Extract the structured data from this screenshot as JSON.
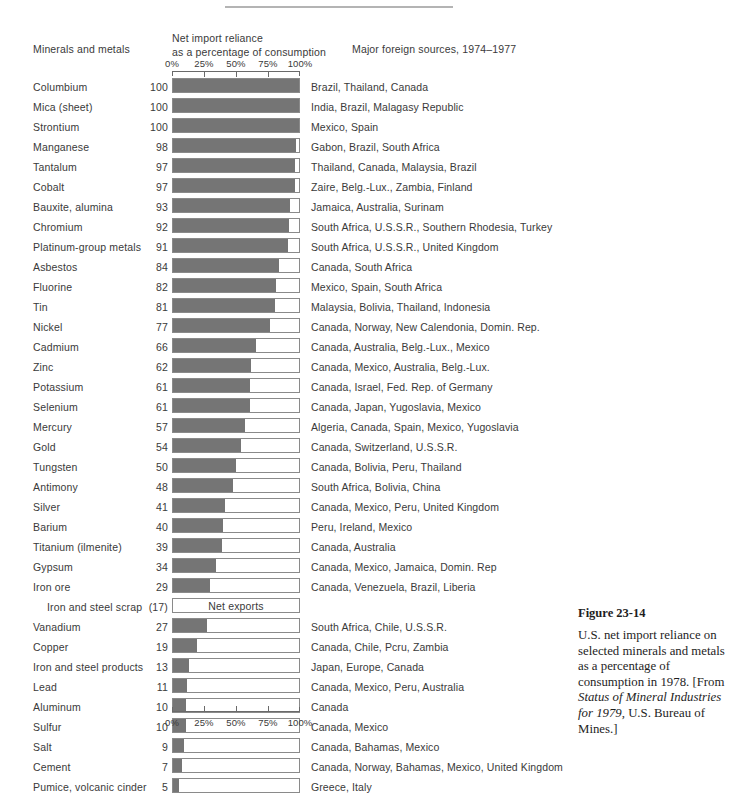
{
  "header": {
    "minerals_label": "Minerals and metals",
    "reliance_line1": "Net import reliance",
    "reliance_line2": "as a percentage of consumption",
    "sources_label": "Major foreign sources, 1974–1977"
  },
  "figure": {
    "number": "Figure 23-14",
    "caption_part1": "U.S. net import reliance on selected minerals and metals as a percentage of consumption in 1978. [From ",
    "caption_italic1": "Status of Mineral Industries for 1979",
    "caption_part2": ", U.S. Bureau of Mines.]"
  },
  "chart_data": {
    "type": "bar",
    "orientation": "horizontal",
    "title": "U.S. net import reliance on selected minerals and metals as a percentage of consumption in 1978.",
    "xlabel": "Net import reliance as a percentage of consumption",
    "ylabel": "Minerals and metals",
    "xlim": [
      0,
      100
    ],
    "tick_labels": [
      "0%",
      "25%",
      "50%",
      "75%",
      "100%"
    ],
    "tick_values": [
      0,
      25,
      50,
      75,
      100
    ],
    "grid": false,
    "legend": "none",
    "bar_color": "#757575",
    "bar_outline_color": "#8a8a8a",
    "axis_color": "#6a6a6a",
    "categories": [
      "Columbium",
      "Mica (sheet)",
      "Strontium",
      "Manganese",
      "Tantalum",
      "Cobalt",
      "Bauxite, alumina",
      "Chromium",
      "Platinum-group metals",
      "Asbestos",
      "Fluorine",
      "Tin",
      "Nickel",
      "Cadmium",
      "Zinc",
      "Potassium",
      "Selenium",
      "Mercury",
      "Gold",
      "Tungsten",
      "Antimony",
      "Silver",
      "Barium",
      "Titanium (ilmenite)",
      "Gypsum",
      "Iron ore",
      "Iron and steel scrap",
      "Vanadium",
      "Copper",
      "Iron and steel products",
      "Lead",
      "Aluminum",
      "Sulfur",
      "Salt",
      "Cement",
      "Pumice, volcanic cinder"
    ],
    "values": [
      100,
      100,
      100,
      98,
      97,
      97,
      93,
      92,
      91,
      84,
      82,
      81,
      77,
      66,
      62,
      61,
      61,
      57,
      54,
      50,
      48,
      41,
      40,
      39,
      34,
      29,
      -17,
      27,
      19,
      13,
      11,
      10,
      10,
      9,
      7,
      5
    ],
    "rows": [
      {
        "label": "Columbium",
        "value": "100",
        "pct": 100,
        "sources": "Brazil, Thailand, Canada",
        "indent": false
      },
      {
        "label": "Mica (sheet)",
        "value": "100",
        "pct": 100,
        "sources": "India, Brazil, Malagasy Republic",
        "indent": false
      },
      {
        "label": "Strontium",
        "value": "100",
        "pct": 100,
        "sources": "Mexico, Spain",
        "indent": false
      },
      {
        "label": "Manganese",
        "value": "98",
        "pct": 98,
        "sources": "Gabon, Brazil, South Africa",
        "indent": false
      },
      {
        "label": "Tantalum",
        "value": "97",
        "pct": 97,
        "sources": "Thailand, Canada, Malaysia, Brazil",
        "indent": false
      },
      {
        "label": "Cobalt",
        "value": "97",
        "pct": 97,
        "sources": "Zaire, Belg.-Lux., Zambia, Finland",
        "indent": false
      },
      {
        "label": "Bauxite, alumina",
        "value": "93",
        "pct": 93,
        "sources": "Jamaica, Australia, Surinam",
        "indent": false
      },
      {
        "label": "Chromium",
        "value": "92",
        "pct": 92,
        "sources": "South Africa, U.S.S.R., Southern Rhodesia, Turkey",
        "indent": false
      },
      {
        "label": "Platinum-group metals",
        "value": "91",
        "pct": 91,
        "sources": "South Africa, U.S.S.R., United Kingdom",
        "indent": false
      },
      {
        "label": "Asbestos",
        "value": "84",
        "pct": 84,
        "sources": "Canada, South Africa",
        "indent": false
      },
      {
        "label": "Fluorine",
        "value": "82",
        "pct": 82,
        "sources": "Mexico, Spain, South Africa",
        "indent": false
      },
      {
        "label": "Tin",
        "value": "81",
        "pct": 81,
        "sources": "Malaysia, Bolivia, Thailand, Indonesia",
        "indent": false
      },
      {
        "label": "Nickel",
        "value": "77",
        "pct": 77,
        "sources": "Canada, Norway, New Calendonia, Domin. Rep.",
        "indent": false
      },
      {
        "label": "Cadmium",
        "value": "66",
        "pct": 66,
        "sources": "Canada, Australia, Belg.-Lux., Mexico",
        "indent": false
      },
      {
        "label": "Zinc",
        "value": "62",
        "pct": 62,
        "sources": "Canada, Mexico, Australia, Belg.-Lux.",
        "indent": false
      },
      {
        "label": "Potassium",
        "value": "61",
        "pct": 61,
        "sources": "Canada, Israel, Fed. Rep. of Germany",
        "indent": false
      },
      {
        "label": "Selenium",
        "value": "61",
        "pct": 61,
        "sources": "Canada, Japan, Yugoslavia, Mexico",
        "indent": false
      },
      {
        "label": "Mercury",
        "value": "57",
        "pct": 57,
        "sources": "Algeria, Canada, Spain, Mexico, Yugoslavia",
        "indent": false
      },
      {
        "label": "Gold",
        "value": "54",
        "pct": 54,
        "sources": "Canada, Switzerland, U.S.S.R.",
        "indent": false
      },
      {
        "label": "Tungsten",
        "value": "50",
        "pct": 50,
        "sources": "Canada, Bolivia, Peru, Thailand",
        "indent": false
      },
      {
        "label": "Antimony",
        "value": "48",
        "pct": 48,
        "sources": "South Africa, Bolivia, China",
        "indent": false
      },
      {
        "label": "Silver",
        "value": "41",
        "pct": 41,
        "sources": "Canada, Mexico, Peru, United Kingdom",
        "indent": false
      },
      {
        "label": "Barium",
        "value": "40",
        "pct": 40,
        "sources": "Peru, Ireland, Mexico",
        "indent": false
      },
      {
        "label": "Titanium (ilmenite)",
        "value": "39",
        "pct": 39,
        "sources": "Canada, Australia",
        "indent": false
      },
      {
        "label": "Gypsum",
        "value": "34",
        "pct": 34,
        "sources": "Canada, Mexico, Jamaica, Domin. Rep",
        "indent": false
      },
      {
        "label": "Iron ore",
        "value": "29",
        "pct": 29,
        "sources": "Canada, Venezuela, Brazil, Liberia",
        "indent": false
      },
      {
        "label": "Iron and steel scrap",
        "value": "(17)",
        "pct": 0,
        "sources": "",
        "indent": true,
        "note": "Net exports"
      },
      {
        "label": "Vanadium",
        "value": "27",
        "pct": 27,
        "sources": "South Africa, Chile, U.S.S.R.",
        "indent": false
      },
      {
        "label": "Copper",
        "value": "19",
        "pct": 19,
        "sources": "Canada, Chile, Pcru, Zambia",
        "indent": false
      },
      {
        "label": "Iron and steel products",
        "value": "13",
        "pct": 13,
        "sources": "Japan, Europe, Canada",
        "indent": false
      },
      {
        "label": "Lead",
        "value": "11",
        "pct": 11,
        "sources": "Canada, Mexico, Peru, Australia",
        "indent": false
      },
      {
        "label": "Aluminum",
        "value": "10",
        "pct": 10,
        "sources": "Canada",
        "indent": false
      },
      {
        "label": "Sulfur",
        "value": "10",
        "pct": 10,
        "sources": "Canada, Mexico",
        "indent": false
      },
      {
        "label": "Salt",
        "value": "9",
        "pct": 9,
        "sources": "Canada, Bahamas, Mexico",
        "indent": false
      },
      {
        "label": "Cement",
        "value": "7",
        "pct": 7,
        "sources": "Canada, Norway, Bahamas, Mexico, United Kingdom",
        "indent": false
      },
      {
        "label": "Pumice, volcanic cinder",
        "value": "5",
        "pct": 5,
        "sources": "Greece, Italy",
        "indent": false
      }
    ]
  }
}
